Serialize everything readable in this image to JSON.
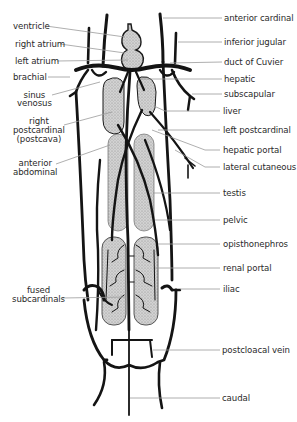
{
  "diagram": {
    "colors": {
      "vessel": "#141414",
      "organ_fill": "#c9c9c9",
      "leader_line": "#9a9a9a",
      "label_text": "#2a2a2a",
      "background": "#ffffff"
    },
    "labels_left": [
      {
        "id": "ventricle",
        "text": "ventricle"
      },
      {
        "id": "right-atrium",
        "text": "right atrium"
      },
      {
        "id": "left-atrium",
        "text": "left atrium"
      },
      {
        "id": "brachial",
        "text": "brachial"
      },
      {
        "id": "sinus-venosus",
        "text": "sinus\nvenosus"
      },
      {
        "id": "right-postcardinal",
        "text": "right\npostcardinal\n(postcava)"
      },
      {
        "id": "anterior-abdominal",
        "text": "anterior\nabdominal"
      },
      {
        "id": "fused-subcardinals",
        "text": "fused\nsubcardinals"
      }
    ],
    "labels_right": [
      {
        "id": "anterior-cardinal",
        "text": "anterior cardinal"
      },
      {
        "id": "inferior-jugular",
        "text": "inferior jugular"
      },
      {
        "id": "duct-of-cuvier",
        "text": "duct of Cuvier"
      },
      {
        "id": "hepatic",
        "text": "hepatic"
      },
      {
        "id": "subscapular",
        "text": "subscapular"
      },
      {
        "id": "liver",
        "text": "liver"
      },
      {
        "id": "left-postcardinal",
        "text": "left postcardinal"
      },
      {
        "id": "hepatic-portal",
        "text": "hepatic portal"
      },
      {
        "id": "lateral-cutaneous",
        "text": "lateral cutaneous"
      },
      {
        "id": "testis",
        "text": "testis"
      },
      {
        "id": "pelvic",
        "text": "pelvic"
      },
      {
        "id": "opisthonephros",
        "text": "opisthonephros"
      },
      {
        "id": "renal-portal",
        "text": "renal portal"
      },
      {
        "id": "iliac",
        "text": "iliac"
      },
      {
        "id": "postcloacal-vein",
        "text": "postcloacal vein"
      },
      {
        "id": "caudal",
        "text": "caudal"
      }
    ]
  }
}
